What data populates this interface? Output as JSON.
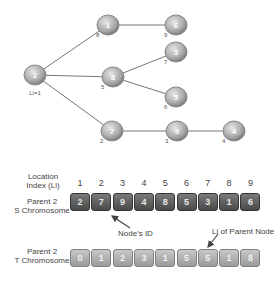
{
  "tree": {
    "root_label": "Li=1",
    "nodes": [
      {
        "id": "2",
        "li": "",
        "x": 35,
        "y": 75
      },
      {
        "id": "1",
        "li": "8",
        "x": 108,
        "y": 25
      },
      {
        "id": "6",
        "li": "9",
        "x": 176,
        "y": 25
      },
      {
        "id": "8",
        "li": "5",
        "x": 113,
        "y": 77
      },
      {
        "id": "3",
        "li": "7",
        "x": 176,
        "y": 52
      },
      {
        "id": "5",
        "li": "6",
        "x": 176,
        "y": 97
      },
      {
        "id": "7",
        "li": "2",
        "x": 112,
        "y": 131
      },
      {
        "id": "9",
        "li": "3",
        "x": 177,
        "y": 131
      },
      {
        "id": "4",
        "li": "4",
        "x": 234,
        "y": 131
      }
    ]
  },
  "labels": {
    "location_index": "Location Index (Li)",
    "s_chromosome": "Parent 2 S Chromosome",
    "t_chromosome": "Parent 2 T Chromosome",
    "node_id_annotation": "Node's ID",
    "parent_li_annotation": "Li of Parent Node"
  },
  "location_indices": [
    "1",
    "2",
    "3",
    "4",
    "5",
    "6",
    "7",
    "8",
    "9"
  ],
  "s_chromosome": [
    "2",
    "7",
    "9",
    "4",
    "8",
    "5",
    "3",
    "1",
    "6"
  ],
  "t_chromosome": [
    "0",
    "1",
    "2",
    "3",
    "1",
    "5",
    "5",
    "1",
    "8"
  ]
}
